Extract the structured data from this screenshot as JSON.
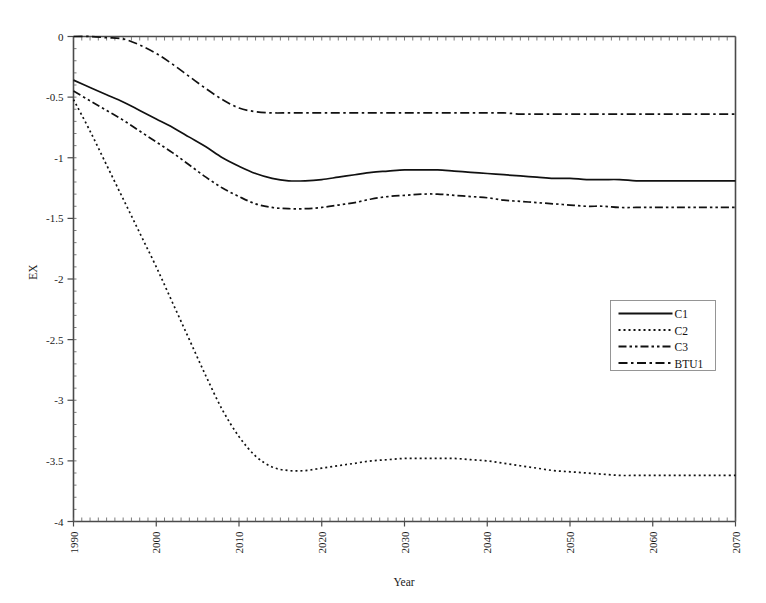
{
  "chart_data": {
    "type": "line",
    "title": "",
    "xlabel": "Year",
    "ylabel": "EX",
    "xlim": [
      1990,
      2070
    ],
    "ylim": [
      -4,
      0
    ],
    "grid": false,
    "legend_position": "center-right",
    "x_tick_labels": [
      "1990",
      "2000",
      "2010",
      "2020",
      "2030",
      "2040",
      "2050",
      "2060",
      "2070"
    ],
    "x_ticks": [
      1990,
      2000,
      2010,
      2020,
      2030,
      2040,
      2050,
      2060,
      2070
    ],
    "x_minor_tick_step": 1,
    "y_tick_labels": [
      "0",
      "-0.5",
      "-1",
      "-1.5",
      "-2",
      "-2.5",
      "-3",
      "-3.5",
      "-4"
    ],
    "y_ticks": [
      0,
      -0.5,
      -1,
      -1.5,
      -2,
      -2.5,
      -3,
      -3.5,
      -4
    ],
    "x": [
      1990,
      1992,
      1994,
      1996,
      1998,
      2000,
      2002,
      2004,
      2006,
      2008,
      2010,
      2012,
      2014,
      2016,
      2018,
      2020,
      2022,
      2024,
      2026,
      2028,
      2030,
      2032,
      2034,
      2036,
      2038,
      2040,
      2042,
      2044,
      2046,
      2048,
      2050,
      2052,
      2054,
      2056,
      2058,
      2060,
      2062,
      2064,
      2066,
      2068,
      2070
    ],
    "series": [
      {
        "name": "C1",
        "style": "solid",
        "color": "#111111",
        "values": [
          -0.36,
          -0.42,
          -0.48,
          -0.54,
          -0.61,
          -0.68,
          -0.75,
          -0.83,
          -0.91,
          -1.0,
          -1.07,
          -1.13,
          -1.17,
          -1.19,
          -1.19,
          -1.18,
          -1.16,
          -1.14,
          -1.12,
          -1.11,
          -1.1,
          -1.1,
          -1.1,
          -1.11,
          -1.12,
          -1.13,
          -1.14,
          -1.15,
          -1.16,
          -1.17,
          -1.17,
          -1.18,
          -1.18,
          -1.18,
          -1.19,
          -1.19,
          -1.19,
          -1.19,
          -1.19,
          -1.19,
          -1.19
        ]
      },
      {
        "name": "C2",
        "style": "dotted",
        "color": "#111111",
        "values": [
          -0.52,
          -0.78,
          -1.06,
          -1.34,
          -1.62,
          -1.9,
          -2.2,
          -2.5,
          -2.8,
          -3.08,
          -3.3,
          -3.46,
          -3.55,
          -3.58,
          -3.58,
          -3.56,
          -3.54,
          -3.52,
          -3.5,
          -3.49,
          -3.48,
          -3.48,
          -3.48,
          -3.48,
          -3.49,
          -3.5,
          -3.52,
          -3.54,
          -3.56,
          -3.58,
          -3.59,
          -3.6,
          -3.61,
          -3.62,
          -3.62,
          -3.62,
          -3.62,
          -3.62,
          -3.62,
          -3.62,
          -3.62
        ]
      },
      {
        "name": "C3",
        "style": "dashdotdot",
        "color": "#111111",
        "values": [
          -0.45,
          -0.53,
          -0.61,
          -0.69,
          -0.78,
          -0.87,
          -0.96,
          -1.06,
          -1.16,
          -1.25,
          -1.32,
          -1.38,
          -1.41,
          -1.42,
          -1.42,
          -1.41,
          -1.39,
          -1.37,
          -1.34,
          -1.32,
          -1.31,
          -1.3,
          -1.3,
          -1.31,
          -1.32,
          -1.33,
          -1.35,
          -1.36,
          -1.37,
          -1.38,
          -1.39,
          -1.4,
          -1.4,
          -1.41,
          -1.41,
          -1.41,
          -1.41,
          -1.41,
          -1.41,
          -1.41,
          -1.41
        ]
      },
      {
        "name": "BTU1",
        "style": "dashdot",
        "color": "#111111",
        "values": [
          0.0,
          0.0,
          -0.01,
          -0.02,
          -0.07,
          -0.14,
          -0.23,
          -0.33,
          -0.43,
          -0.52,
          -0.59,
          -0.62,
          -0.63,
          -0.63,
          -0.63,
          -0.63,
          -0.63,
          -0.63,
          -0.63,
          -0.63,
          -0.63,
          -0.63,
          -0.63,
          -0.63,
          -0.63,
          -0.63,
          -0.63,
          -0.64,
          -0.64,
          -0.64,
          -0.64,
          -0.64,
          -0.64,
          -0.64,
          -0.64,
          -0.64,
          -0.64,
          -0.64,
          -0.64,
          -0.64,
          -0.64
        ]
      }
    ],
    "legend": [
      {
        "label": "C1",
        "style": "solid"
      },
      {
        "label": "C2",
        "style": "dotted"
      },
      {
        "label": "C3",
        "style": "dashdotdot"
      },
      {
        "label": "BTU1",
        "style": "dashdot"
      }
    ]
  }
}
